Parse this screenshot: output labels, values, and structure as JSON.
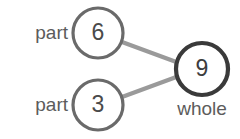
{
  "diagram": {
    "type": "number-bond",
    "background_color": "#ffffff",
    "part_circle_stroke": "#6a6a6a",
    "whole_circle_stroke": "#3a3a3a",
    "connector_color": "#9a9a9a",
    "text_color": "#5c5c5c",
    "value_color": "#4a4a4a",
    "nodes": [
      {
        "id": "part-top",
        "value": "6",
        "label": "part",
        "label_position": "left",
        "cx": 98,
        "cy": 33,
        "r": 25,
        "stroke_width": 3.2
      },
      {
        "id": "part-bottom",
        "value": "3",
        "label": "part",
        "label_position": "left",
        "cx": 98,
        "cy": 105,
        "r": 25,
        "stroke_width": 3.2
      },
      {
        "id": "whole",
        "value": "9",
        "label": "whole",
        "label_position": "below",
        "cx": 202,
        "cy": 69,
        "r": 26,
        "stroke_width": 4.2
      }
    ],
    "connectors": [
      {
        "id": "top-to-whole",
        "from": "part-top",
        "to": "whole",
        "x1": 122,
        "y1": 42,
        "x2": 179,
        "y2": 63
      },
      {
        "id": "bottom-to-whole",
        "from": "part-bottom",
        "to": "whole",
        "x1": 122,
        "y1": 97,
        "x2": 179,
        "y2": 76
      }
    ]
  }
}
